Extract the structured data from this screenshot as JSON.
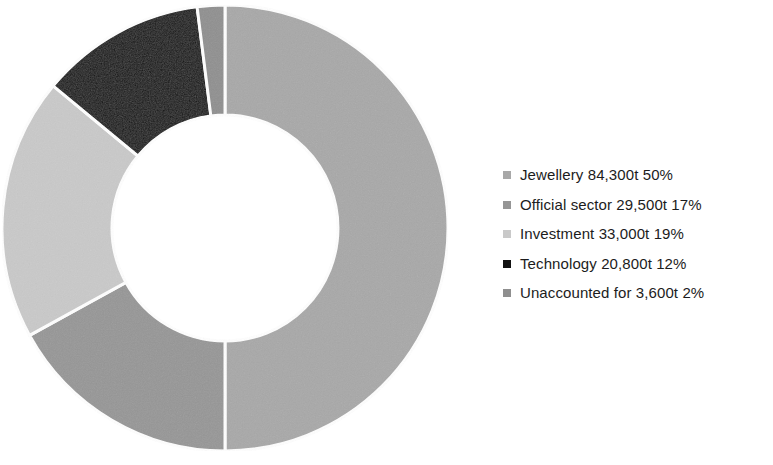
{
  "chart_data": {
    "type": "pie",
    "variant": "donut",
    "title": "",
    "subtitle": "",
    "xlabel": "",
    "ylabel": "",
    "grid": false,
    "legend_position": "right",
    "start_angle_deg": 0,
    "direction": "clockwise",
    "center": {
      "x": 225,
      "y": 228
    },
    "outer_radius": 223,
    "inner_radius": 113,
    "separator_color": "#ffffff",
    "separator_width": 3,
    "categories": [
      "Jewellery",
      "Official sector",
      "Investment",
      "Technology",
      "Unaccounted for"
    ],
    "values": [
      84300,
      29500,
      33000,
      20800,
      3600
    ],
    "value_unit": "t",
    "percentages": [
      50,
      17,
      19,
      12,
      2
    ],
    "colors": [
      "#a8a8a8",
      "#969696",
      "#c9c9c9",
      "#121212",
      "#8f8f8f"
    ],
    "slices": [
      {
        "name": "Jewellery",
        "value": 84300,
        "value_text": "84,300t",
        "percent": 50,
        "percent_text": "50%",
        "color": "#a8a8a8",
        "start_deg": 0,
        "end_deg": 180
      },
      {
        "name": "Official sector",
        "value": 29500,
        "value_text": "29,500t",
        "percent": 17,
        "percent_text": "17%",
        "color": "#969696",
        "start_deg": 180,
        "end_deg": 241.2
      },
      {
        "name": "Investment",
        "value": 33000,
        "value_text": "33,000t",
        "percent": 19,
        "percent_text": "19%",
        "color": "#c9c9c9",
        "start_deg": 241.2,
        "end_deg": 309.6
      },
      {
        "name": "Technology",
        "value": 20800,
        "value_text": "20,800t",
        "percent": 12,
        "percent_text": "12%",
        "color": "#121212",
        "start_deg": 309.6,
        "end_deg": 352.8
      },
      {
        "name": "Unaccounted for",
        "value": 3600,
        "value_text": "3,600t",
        "percent": 2,
        "percent_text": "2%",
        "color": "#8f8f8f",
        "start_deg": 352.8,
        "end_deg": 360
      }
    ]
  },
  "legend": {
    "items": [
      {
        "label": "Jewellery 84,300t 50%",
        "color": "#a8a8a8"
      },
      {
        "label": "Official sector 29,500t 17%",
        "color": "#969696"
      },
      {
        "label": "Investment 33,000t 19%",
        "color": "#c9c9c9"
      },
      {
        "label": "Technology 20,800t 12%",
        "color": "#121212"
      },
      {
        "label": "Unaccounted for 3,600t 2%",
        "color": "#8f8f8f"
      }
    ]
  },
  "canvas": {
    "background": "#ffffff",
    "text_color": "#1c1c1c"
  }
}
